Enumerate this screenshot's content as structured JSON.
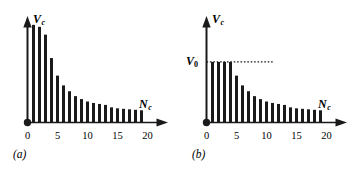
{
  "figure": {
    "background_color": "#ffffff",
    "ink_color": "#1a1a1a",
    "bar_color": "#1a1a1a"
  },
  "panels": [
    {
      "id": "a",
      "caption": "(a)",
      "y_axis_label": "V",
      "y_axis_sub": "c",
      "x_axis_label": "N",
      "x_axis_sub": "c",
      "origin_marker": "filled-dot",
      "x_ticks": [
        "0",
        "5",
        "10",
        "15",
        "20"
      ]
    },
    {
      "id": "b",
      "caption": "(b)",
      "y_axis_label": "V",
      "y_axis_sub": "c",
      "x_axis_label": "N",
      "x_axis_sub": "c",
      "origin_marker": "filled-dot",
      "x_ticks": [
        "0",
        "5",
        "10",
        "15",
        "20"
      ],
      "reference_level_label": "V",
      "reference_level_sub": "0",
      "reference_line_style": "dotted"
    }
  ],
  "chart_data": [
    {
      "type": "bar",
      "panel": "(a)",
      "title": "",
      "xlabel": "N_c",
      "ylabel": "V_c",
      "xlim": [
        0,
        23
      ],
      "ylim": [
        0,
        1.06
      ],
      "grid": false,
      "legend": "none",
      "x": [
        1,
        2,
        3,
        4,
        5,
        6,
        7,
        8,
        9,
        10,
        11,
        12,
        13,
        14,
        15,
        16,
        17,
        18,
        19
      ],
      "values": [
        1.0,
        0.98,
        0.9,
        0.66,
        0.48,
        0.38,
        0.32,
        0.27,
        0.24,
        0.215,
        0.2,
        0.19,
        0.18,
        0.155,
        0.145,
        0.14,
        0.135,
        0.13,
        0.125
      ],
      "xtick_values": [
        0,
        5,
        10,
        15,
        20
      ],
      "xtick_labels": [
        "0",
        "5",
        "10",
        "15",
        "20"
      ],
      "ytick_labels": [],
      "annotations": [
        "bars 1 and 2 are clipped by the top of the axis"
      ]
    },
    {
      "type": "bar",
      "panel": "(b)",
      "title": "",
      "xlabel": "N_c",
      "ylabel": "V_c",
      "xlim": [
        0,
        23
      ],
      "ylim": [
        0,
        1.06
      ],
      "grid": false,
      "legend": "none",
      "x": [
        1,
        2,
        3,
        4,
        5,
        6,
        7,
        8,
        9,
        10,
        11,
        12,
        13,
        14,
        15,
        16,
        17,
        18,
        19
      ],
      "values": [
        0.62,
        0.62,
        0.62,
        0.62,
        0.48,
        0.38,
        0.32,
        0.27,
        0.24,
        0.215,
        0.2,
        0.19,
        0.18,
        0.155,
        0.145,
        0.14,
        0.135,
        0.13,
        0.125
      ],
      "xtick_values": [
        0,
        5,
        10,
        15,
        20
      ],
      "xtick_labels": [
        "0",
        "5",
        "10",
        "15",
        "20"
      ],
      "ytick_labels": [
        "V_0"
      ],
      "reference_line": {
        "y": 0.62,
        "label": "V_0",
        "style": "dotted",
        "x_end": 11.2
      },
      "annotations": [
        "first four bars saturate at V_0"
      ]
    }
  ]
}
